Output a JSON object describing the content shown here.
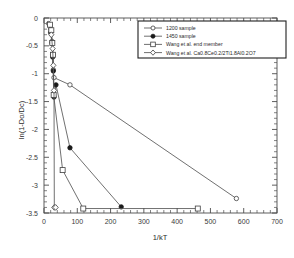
{
  "chart_data": {
    "type": "line",
    "title": "",
    "xlabel": "1/kT",
    "ylabel": "ln(1-Do/Dc)",
    "xlim": [
      0,
      700
    ],
    "ylim": [
      -3.5,
      0
    ],
    "xticks": [
      0,
      100,
      200,
      300,
      400,
      500,
      600,
      700
    ],
    "xticklabels": [
      "0",
      "100",
      "200",
      "300",
      "400",
      "500",
      "600",
      "700"
    ],
    "yticks": [
      0,
      -0.5,
      -1,
      -1.5,
      -2,
      -2.5,
      -3,
      -3.5
    ],
    "yticklabels": [
      "0",
      "-0.5",
      "-1",
      "-1.5",
      "-2",
      "-2.5",
      "-3",
      "-3.5"
    ],
    "grid": false,
    "legend_position": "top-right",
    "series": [
      {
        "name": "1200 sample",
        "marker": "open-circle",
        "points": [
          {
            "x": 14,
            "y": -0.1
          },
          {
            "x": 20,
            "y": -0.2
          },
          {
            "x": 24,
            "y": -0.42
          },
          {
            "x": 26,
            "y": -0.66
          },
          {
            "x": 28,
            "y": -0.93
          },
          {
            "x": 30,
            "y": -1.07
          },
          {
            "x": 78,
            "y": -1.2
          },
          {
            "x": 578,
            "y": -3.24
          }
        ]
      },
      {
        "name": "1450 sample",
        "marker": "filled-circle",
        "points": [
          {
            "x": 20,
            "y": -0.26
          },
          {
            "x": 24,
            "y": -0.45
          },
          {
            "x": 26,
            "y": -0.7
          },
          {
            "x": 28,
            "y": -0.95
          },
          {
            "x": 30,
            "y": -1.42
          },
          {
            "x": 36,
            "y": -1.2
          },
          {
            "x": 78,
            "y": -2.33
          },
          {
            "x": 232,
            "y": -3.39
          }
        ]
      },
      {
        "name": "Wang et al. end member",
        "marker": "open-square",
        "points": [
          {
            "x": 18,
            "y": -0.12
          },
          {
            "x": 22,
            "y": -0.22
          },
          {
            "x": 25,
            "y": -0.45
          },
          {
            "x": 27,
            "y": -0.66
          },
          {
            "x": 29,
            "y": -1.38
          },
          {
            "x": 56,
            "y": -2.73
          },
          {
            "x": 118,
            "y": -3.42
          },
          {
            "x": 462,
            "y": -3.42
          }
        ]
      },
      {
        "name": "Wang et al. Ca0.8Ce0.2/2Ti1.8Al0.2O7",
        "marker": "open-diamond",
        "points": [
          {
            "x": 22,
            "y": -0.3
          },
          {
            "x": 26,
            "y": -0.55
          },
          {
            "x": 28,
            "y": -0.85
          },
          {
            "x": 30,
            "y": -1.3
          },
          {
            "x": 31,
            "y": -3.4
          },
          {
            "x": 35,
            "y": -3.4
          }
        ]
      }
    ]
  },
  "legend": {
    "entries": [
      {
        "label": "1200 sample",
        "marker": "open-circle"
      },
      {
        "label": "1450 sample",
        "marker": "filled-circle"
      },
      {
        "label": "Wang et al. end member",
        "marker": "open-square"
      },
      {
        "label": "Wang et al. Ca0.8Ce0.2/2Ti1.8Al0.2O7",
        "marker": "open-diamond"
      }
    ]
  },
  "colors": {
    "axis": "#4d4d4d",
    "line": "#565656",
    "marker_fill_open": "#ffffff",
    "marker_fill_solid": "#1a1a1a",
    "legend_border": "#1f1f1f",
    "background": "#ffffff"
  }
}
